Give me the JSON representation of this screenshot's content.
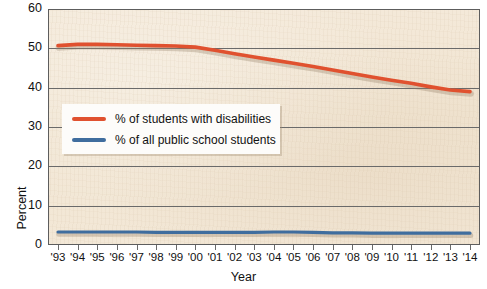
{
  "figure": {
    "background_color": "#ffffff",
    "plot_background_color": "#f2e7d6",
    "frame_color": "#5d5d5d"
  },
  "axes": {
    "y_title": "Percent",
    "x_title": "Year",
    "y_ticks": [
      "60",
      "50",
      "40",
      "30",
      "20",
      "10",
      "0"
    ],
    "x_ticks": [
      "'93",
      "'94",
      "'95",
      "'96",
      "'97",
      "'98",
      "'99",
      "'00",
      "'01",
      "'02",
      "'03",
      "'04",
      "'05",
      "'06",
      "'07",
      "'08",
      "'09",
      "'10",
      "'11",
      "'12",
      "'13",
      "'14"
    ]
  },
  "legend": {
    "items": [
      {
        "label": "% of students with disabilities",
        "color": "#e0512f"
      },
      {
        "label": "% of all public school students",
        "color": "#3f6d9e"
      }
    ]
  },
  "chart_data": {
    "type": "line",
    "title": "",
    "xlabel": "Year",
    "ylabel": "Percent",
    "ylim": [
      0,
      60
    ],
    "yticks": [
      0,
      10,
      20,
      30,
      40,
      50,
      60
    ],
    "grid": true,
    "legend_position": "inside-left",
    "categories": [
      "'93",
      "'94",
      "'95",
      "'96",
      "'97",
      "'98",
      "'99",
      "'00",
      "'01",
      "'02",
      "'03",
      "'04",
      "'05",
      "'06",
      "'07",
      "'08",
      "'09",
      "'10",
      "'11",
      "'12",
      "'13",
      "'14"
    ],
    "x": [
      1993,
      1994,
      1995,
      1996,
      1997,
      1998,
      1999,
      2000,
      2001,
      2002,
      2003,
      2004,
      2005,
      2006,
      2007,
      2008,
      2009,
      2010,
      2011,
      2012,
      2013,
      2014
    ],
    "series": [
      {
        "name": "% of students with disabilities",
        "color": "#e0512f",
        "values": [
          50.7,
          51.0,
          51.0,
          50.9,
          50.8,
          50.7,
          50.6,
          50.3,
          49.5,
          48.6,
          47.8,
          47.0,
          46.2,
          45.4,
          44.5,
          43.6,
          42.7,
          41.9,
          41.1,
          40.2,
          39.4,
          39.0
        ]
      },
      {
        "name": "% of all public school students",
        "color": "#3f6d9e",
        "values": [
          3.3,
          3.3,
          3.3,
          3.3,
          3.3,
          3.2,
          3.2,
          3.2,
          3.2,
          3.2,
          3.2,
          3.3,
          3.3,
          3.2,
          3.1,
          3.1,
          3.0,
          3.0,
          3.0,
          3.0,
          3.0,
          3.0
        ]
      }
    ]
  }
}
